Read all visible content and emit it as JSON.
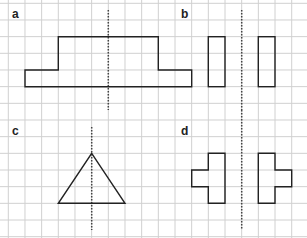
{
  "grid": {
    "spacing": 16.67,
    "origin_x": 8.3,
    "origin_y": 3.3,
    "line_color": "#d0d0d0",
    "background": "#ffffff"
  },
  "colors": {
    "shape_stroke": "#222222",
    "axis_stroke": "#444444"
  },
  "panels": [
    {
      "label": "a",
      "label_pos": [
        12,
        8
      ],
      "axis": {
        "x": 108.3,
        "y1": 10,
        "y2": 110
      },
      "shapes": [
        {
          "type": "polygon",
          "points": [
            [
              25,
              86.7
            ],
            [
              25,
              70
            ],
            [
              58.3,
              70
            ],
            [
              58.3,
              36.7
            ],
            [
              158.3,
              36.7
            ],
            [
              158.3,
              70
            ],
            [
              191.7,
              70
            ],
            [
              191.7,
              86.7
            ]
          ]
        }
      ]
    },
    {
      "label": "b",
      "label_pos": [
        181,
        8
      ],
      "axis": {
        "x": 241.7,
        "y1": 10,
        "y2": 110
      },
      "shapes": [
        {
          "type": "rect",
          "x": 208.3,
          "y": 36.7,
          "w": 16.7,
          "h": 50
        },
        {
          "type": "rect",
          "x": 258.3,
          "y": 36.7,
          "w": 16.7,
          "h": 50
        }
      ]
    },
    {
      "label": "c",
      "label_pos": [
        12,
        125
      ],
      "axis": {
        "x": 91.7,
        "y1": 127,
        "y2": 230
      },
      "shapes": [
        {
          "type": "polygon",
          "points": [
            [
              91.7,
              153.3
            ],
            [
              125,
              203.3
            ],
            [
              58.3,
              203.3
            ]
          ]
        }
      ]
    },
    {
      "label": "d",
      "label_pos": [
        181,
        125
      ],
      "axis": {
        "x": 241.7,
        "y1": 110,
        "y2": 230
      },
      "shapes": [
        {
          "type": "polygon",
          "points": [
            [
              208.3,
              153.3
            ],
            [
              225,
              153.3
            ],
            [
              225,
              203.3
            ],
            [
              208.3,
              203.3
            ],
            [
              208.3,
              186.7
            ],
            [
              191.7,
              186.7
            ],
            [
              191.7,
              170
            ],
            [
              208.3,
              170
            ]
          ]
        },
        {
          "type": "polygon",
          "points": [
            [
              258.3,
              153.3
            ],
            [
              275,
              153.3
            ],
            [
              275,
              170
            ],
            [
              291.7,
              170
            ],
            [
              291.7,
              186.7
            ],
            [
              275,
              186.7
            ],
            [
              275,
              203.3
            ],
            [
              258.3,
              203.3
            ]
          ]
        }
      ]
    }
  ]
}
